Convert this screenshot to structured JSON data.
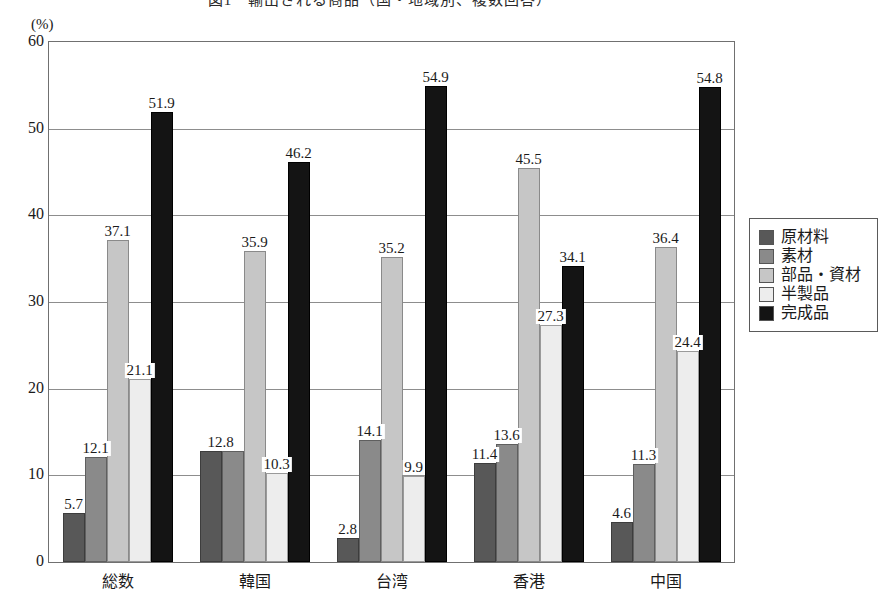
{
  "chart_data": {
    "type": "bar",
    "title": "図1　輸出される商品（国・地域別、複数回答）",
    "xlabel": "",
    "ylabel": "",
    "y_unit": "(%)",
    "ylim": [
      0,
      60
    ],
    "yticks": [
      0,
      10,
      20,
      30,
      40,
      50,
      60
    ],
    "grid": true,
    "legend_position": "right",
    "categories": [
      "総数",
      "韓国",
      "台湾",
      "香港",
      "中国"
    ],
    "series": [
      {
        "name": "原材料",
        "color": "#585858",
        "values": [
          5.7,
          12.8,
          2.8,
          11.4,
          4.6
        ]
      },
      {
        "name": "素材",
        "color": "#8a8a8a",
        "values": [
          12.1,
          12.8,
          14.1,
          13.6,
          11.3
        ]
      },
      {
        "name": "部品・資材",
        "color": "#c6c6c6",
        "values": [
          37.1,
          35.9,
          35.2,
          45.5,
          36.4
        ]
      },
      {
        "name": "半製品",
        "color": "#ededed",
        "values": [
          21.1,
          10.3,
          9.9,
          27.3,
          24.4
        ]
      },
      {
        "name": "完成品",
        "color": "#141414",
        "values": [
          51.9,
          46.2,
          54.9,
          34.1,
          54.8
        ]
      }
    ],
    "point_labels": [
      [
        "5.7",
        "12.1",
        "37.1",
        "21.1",
        "51.9"
      ],
      [
        "12.8",
        "",
        "35.9",
        "10.3",
        "46.2"
      ],
      [
        "2.8",
        "14.1",
        "35.2",
        "9.9",
        "54.9"
      ],
      [
        "11.4",
        "13.6",
        "45.5",
        "27.3",
        "34.1"
      ],
      [
        "4.6",
        "11.3",
        "36.4",
        "24.4",
        "54.8"
      ]
    ],
    "shared_label_groups": [
      {
        "group": 1,
        "series": 0,
        "spans": 2,
        "label": "12.8"
      }
    ]
  }
}
